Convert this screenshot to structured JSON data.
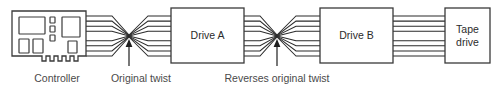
{
  "diagram": {
    "canvas": {
      "width": 494,
      "height": 94
    },
    "colors": {
      "background": "#ffffff",
      "stroke": "#3a3a3a",
      "wire": "#2a2a2a",
      "text": "#2b2b2b",
      "caption_text": "#4a4a4a",
      "arrow": "#1f1f1f"
    },
    "nodes": [
      {
        "id": "controller",
        "kind": "expansion-card",
        "label": "",
        "x": 12,
        "y": 11,
        "width": 74,
        "height": 50
      },
      {
        "id": "drive-a",
        "kind": "box",
        "label": "Drive A",
        "x": 171,
        "y": 8,
        "width": 73,
        "height": 55
      },
      {
        "id": "drive-b",
        "kind": "box",
        "label": "Drive B",
        "x": 320,
        "y": 8,
        "width": 73,
        "height": 55
      },
      {
        "id": "tape-drive",
        "kind": "box",
        "label": "Tape drive",
        "x": 445,
        "y": 8,
        "width": 45,
        "height": 55
      }
    ],
    "node_labels": {
      "drive_a": "Drive A",
      "drive_b": "Drive B",
      "tape_drive_line1": "Tape",
      "tape_drive_line2": "drive"
    },
    "captions": [
      {
        "id": "controller-caption",
        "text": "Controller",
        "x": 57,
        "y": 78
      },
      {
        "id": "original-twist-caption",
        "text": "Original twist",
        "x": 141,
        "y": 78
      },
      {
        "id": "reverses-twist-caption",
        "text": "Reverses original twist",
        "x": 277,
        "y": 78
      }
    ],
    "caption_text": {
      "controller": "Controller",
      "original_twist": "Original twist",
      "reverses_original_twist": "Reverses original twist"
    },
    "cable": {
      "conductor_count": 8,
      "upper_group_count": 4,
      "lower_group_count": 4,
      "spacing_px": 5.1,
      "top_y": 16,
      "bottom_y": 56
    },
    "twists": [
      {
        "id": "twist-1",
        "label": "Original twist",
        "crossing_x": 129,
        "crossing_y": 36,
        "arrow_tip_y": 40,
        "arrow_tail_y": 66
      },
      {
        "id": "twist-2",
        "label": "Reverses original twist",
        "crossing_x": 277,
        "crossing_y": 36,
        "arrow_tip_y": 40,
        "arrow_tail_y": 66
      }
    ],
    "segments": [
      {
        "id": "controller-to-twist1",
        "from": "controller",
        "to": "twist-1"
      },
      {
        "id": "twist1-to-drive-a",
        "from": "twist-1",
        "to": "drive-a"
      },
      {
        "id": "drive-a-to-twist2",
        "from": "drive-a",
        "to": "twist-2"
      },
      {
        "id": "twist2-to-drive-b",
        "from": "twist-2",
        "to": "drive-b"
      },
      {
        "id": "drive-b-to-tape",
        "from": "drive-b",
        "to": "tape-drive"
      }
    ]
  }
}
